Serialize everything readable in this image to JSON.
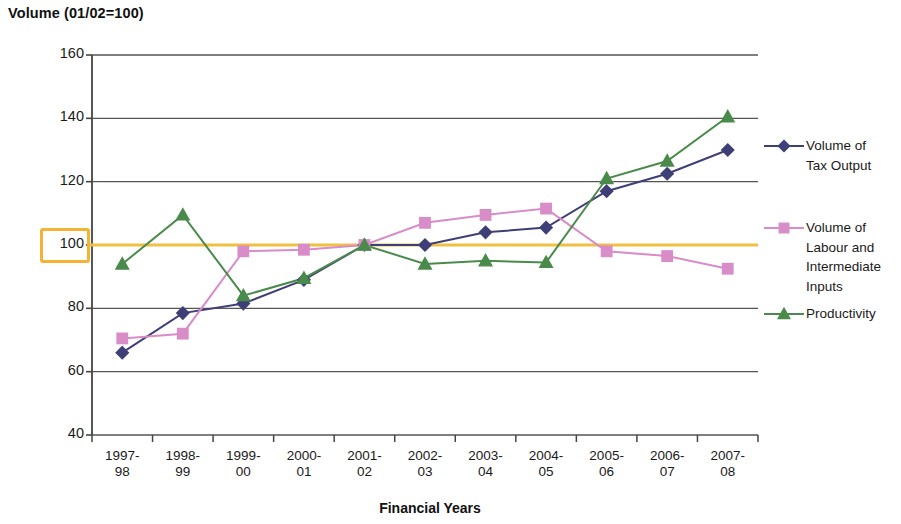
{
  "chart_data": {
    "type": "line",
    "title": "Volume (01/02=100)",
    "xlabel": "Financial Years",
    "ylabel": "",
    "ylim": [
      40,
      160
    ],
    "yticks": [
      40,
      60,
      80,
      100,
      120,
      140,
      160
    ],
    "highlighted_ytick": "100",
    "grid": "horizontal",
    "legend_position": "right",
    "reference_line": {
      "value": 100,
      "color": "#f0c040"
    },
    "categories": [
      "1997-98",
      "1998-99",
      "1999-00",
      "2000-01",
      "2001-02",
      "2002-03",
      "2003-04",
      "2004-05",
      "2005-06",
      "2006-07",
      "2007-08"
    ],
    "series": [
      {
        "name": "Volume of Tax Output",
        "color": "#3f3f78",
        "marker": "diamond",
        "values": [
          66,
          78.5,
          81.5,
          89,
          100,
          100,
          104,
          105.5,
          117,
          122.5,
          130
        ]
      },
      {
        "name": "Volume of Labour and Intermediate Inputs",
        "color": "#d88cc8",
        "marker": "square",
        "values": [
          70.5,
          72,
          98,
          98.5,
          100,
          107,
          109.5,
          111.5,
          98,
          96.5,
          92.5
        ]
      },
      {
        "name": "Productivity",
        "color": "#4a8a4a",
        "marker": "triangle",
        "values": [
          94,
          109.5,
          84,
          89.5,
          100,
          94,
          95,
          94.5,
          121,
          126.5,
          140.5
        ]
      }
    ]
  },
  "axis": {
    "ytick_labels": [
      "160",
      "140",
      "120",
      "100",
      "80",
      "60",
      "40"
    ],
    "xtick_lines": [
      [
        "1997-",
        "98"
      ],
      [
        "1998-",
        "99"
      ],
      [
        "1999-",
        "00"
      ],
      [
        "2000-",
        "01"
      ],
      [
        "2001-",
        "02"
      ],
      [
        "2002-",
        "03"
      ],
      [
        "2003-",
        "04"
      ],
      [
        "2004-",
        "05"
      ],
      [
        "2005-",
        "06"
      ],
      [
        "2006-",
        "07"
      ],
      [
        "2007-",
        "08"
      ]
    ],
    "xaxis_title": "Financial Years"
  },
  "legend": {
    "entries": [
      {
        "label": "Volume of\nTax Output",
        "color": "#3f3f78",
        "marker": "diamond"
      },
      {
        "label": "Volume of\nLabour and\nIntermediate\nInputs",
        "color": "#d88cc8",
        "marker": "square"
      },
      {
        "label": "Productivity",
        "color": "#4a8a4a",
        "marker": "triangle"
      }
    ]
  }
}
